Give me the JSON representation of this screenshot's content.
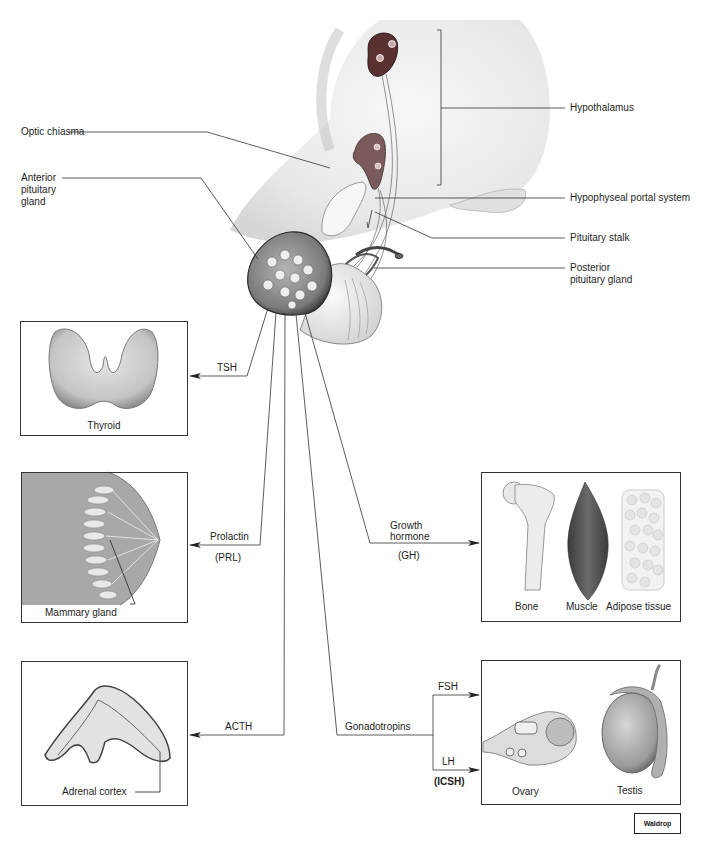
{
  "diagram": {
    "structure_labels": {
      "hypothalamus": "Hypothalamus",
      "optic_chiasma": "Optic chiasma",
      "anterior_pituitary": "Anterior pituitary gland",
      "anterior_pituitary_lines": [
        "Anterior",
        "pituitary",
        "gland"
      ],
      "portal_system": "Hypophyseal portal system",
      "pituitary_stalk": "Pituitary stalk",
      "posterior_pituitary": "Posterior pituitary gland",
      "posterior_pituitary_lines": [
        "Posterior",
        "pituitary gland"
      ]
    },
    "hormones": {
      "tsh": "TSH",
      "prolactin": "Prolactin",
      "prolactin_abbr": "(PRL)",
      "acth": "ACTH",
      "growth_hormone_lines": [
        "Growth",
        "hormone"
      ],
      "growth_hormone_abbr": "(GH)",
      "gonadotropins": "Gonadotropins",
      "fsh": "FSH",
      "lh": "LH",
      "lh_abbr": "(ICSH)"
    },
    "targets": {
      "thyroid": "Thyroid",
      "mammary": "Mammary gland",
      "adrenal": "Adrenal cortex",
      "bone": "Bone",
      "muscle": "Muscle",
      "adipose": "Adipose tissue",
      "ovary": "Ovary",
      "testis": "Testis"
    },
    "credit": "Waldrop"
  },
  "colors": {
    "line": "#333333",
    "tissue_light": "#e6e6e6",
    "tissue_mid": "#b8b8b8",
    "tissue_dark": "#555555",
    "hypothalamus_nucleus": "#5a3030"
  }
}
